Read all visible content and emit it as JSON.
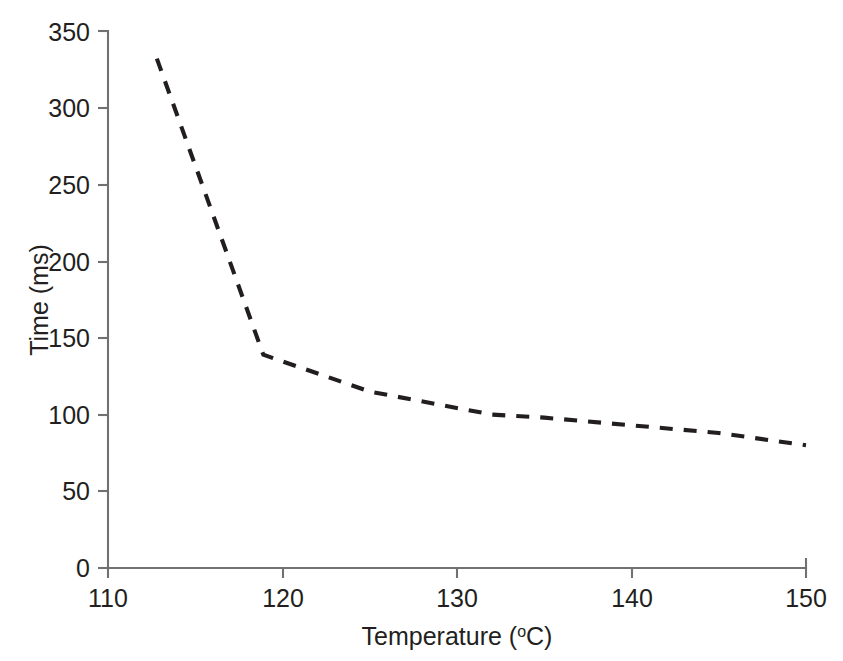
{
  "chart_data": {
    "type": "line",
    "title": "",
    "subtitle": "",
    "xlabel_text": "Temperature (",
    "xlabel_sup": "o",
    "xlabel_tail": "C)",
    "xlabel_full": "Temperature (°C)",
    "ylabel_full": "Time (ms)",
    "xlim": [
      110,
      150
    ],
    "ylim": [
      0,
      350
    ],
    "xticks": [
      110,
      120,
      130,
      140,
      150
    ],
    "xtick_labels": [
      "110",
      "120",
      "130",
      "140",
      "150"
    ],
    "yticks": [
      0,
      50,
      100,
      150,
      200,
      250,
      300,
      350
    ],
    "ytick_labels": [
      "0",
      "50",
      "100",
      "150",
      "200",
      "250",
      "300",
      "350"
    ],
    "grid": false,
    "legend": false,
    "legend_position": "none",
    "line_style": "dashed",
    "line_color": "#221e1f",
    "axis_color": "#6f7173",
    "marker": "none",
    "series": [
      {
        "name": "Time vs Temperature",
        "x": [
          112.8,
          118.9,
          125.0,
          132.0,
          135.0,
          140.0,
          145.0,
          150.0
        ],
        "y": [
          332,
          139,
          115,
          100,
          98,
          93,
          88,
          80
        ]
      }
    ]
  },
  "axes": {
    "x_axis_name": "temperature-axis",
    "y_axis_name": "time-axis"
  }
}
